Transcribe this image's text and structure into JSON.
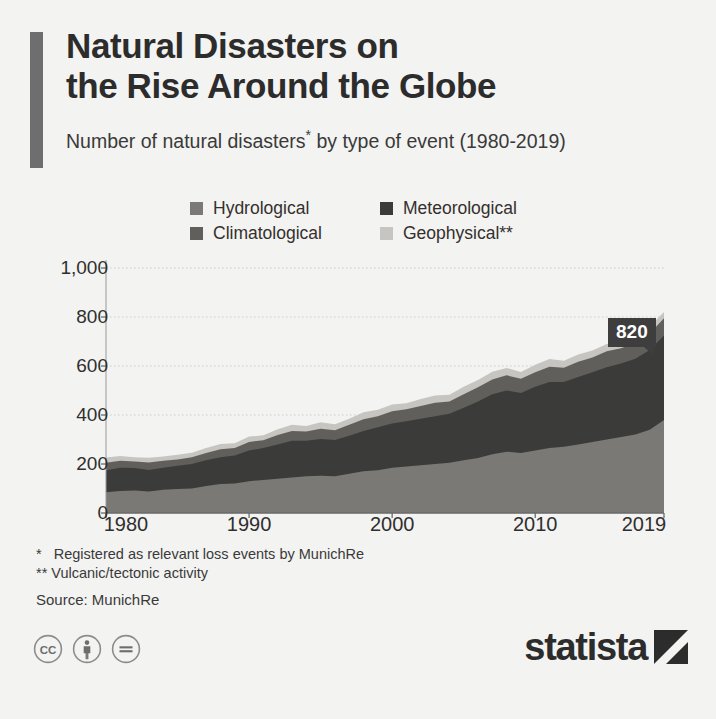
{
  "header": {
    "title": "Natural Disasters on\nthe Rise Around the Globe",
    "subtitle_pre": "Number of natural disasters",
    "subtitle_star": "*",
    "subtitle_post": " by type of event (1980-2019)"
  },
  "legend": {
    "items": [
      {
        "label": "Hydrological",
        "color": "#7a7976"
      },
      {
        "label": "Meteorological",
        "color": "#3b3b39"
      },
      {
        "label": "Climatological",
        "color": "#605f5c"
      },
      {
        "label": "Geophysical**",
        "color": "#c6c5c1"
      }
    ]
  },
  "footnotes": {
    "line1": "*   Registered as relevant loss events by MunichRe",
    "line2": "** Vulcanic/tectonic activity",
    "source": "Source: MunichRe"
  },
  "brand": {
    "word": "statista",
    "mark": "statista-logo-mark"
  },
  "cc_icons": [
    "cc-icon",
    "cc-by-icon",
    "cc-nd-icon"
  ],
  "chart_data": {
    "type": "area",
    "stacked": true,
    "title": "Natural Disasters on the Rise Around the Globe",
    "subtitle": "Number of natural disasters* by type of event (1980-2019)",
    "xlabel": "",
    "ylabel": "",
    "grid": true,
    "legend_position": "top",
    "xlim": [
      1980,
      2019
    ],
    "ylim": [
      0,
      1000
    ],
    "yticks": [
      0,
      200,
      400,
      600,
      800,
      1000
    ],
    "ytick_labels": [
      "0",
      "200",
      "400",
      "600",
      "800",
      "1,000"
    ],
    "xticks": [
      1980,
      1990,
      2000,
      2010,
      2019
    ],
    "xtick_labels": [
      "1980",
      "1990",
      "2000",
      "2010",
      "2019"
    ],
    "x": [
      1980,
      1981,
      1982,
      1983,
      1984,
      1985,
      1986,
      1987,
      1988,
      1989,
      1990,
      1991,
      1992,
      1993,
      1994,
      1995,
      1996,
      1997,
      1998,
      1999,
      2000,
      2001,
      2002,
      2003,
      2004,
      2005,
      2006,
      2007,
      2008,
      2009,
      2010,
      2011,
      2012,
      2013,
      2014,
      2015,
      2016,
      2017,
      2018,
      2019
    ],
    "series": [
      {
        "name": "Hydrological",
        "color": "#7a7976",
        "values": [
          85,
          90,
          92,
          88,
          95,
          98,
          100,
          110,
          118,
          120,
          130,
          135,
          140,
          145,
          150,
          152,
          150,
          160,
          170,
          175,
          185,
          190,
          195,
          200,
          205,
          215,
          225,
          240,
          250,
          245,
          255,
          265,
          270,
          280,
          290,
          300,
          310,
          320,
          340,
          380
        ]
      },
      {
        "name": "Meteorological",
        "color": "#3b3b39",
        "values": [
          90,
          95,
          92,
          88,
          90,
          95,
          100,
          105,
          110,
          115,
          125,
          130,
          140,
          150,
          145,
          150,
          148,
          155,
          165,
          175,
          180,
          185,
          190,
          195,
          200,
          215,
          230,
          245,
          250,
          245,
          260,
          270,
          265,
          275,
          285,
          295,
          300,
          310,
          325,
          345
        ]
      },
      {
        "name": "Climatological",
        "color": "#605f5c",
        "values": [
          30,
          28,
          26,
          30,
          28,
          25,
          28,
          30,
          32,
          30,
          35,
          32,
          38,
          40,
          38,
          42,
          40,
          45,
          48,
          45,
          50,
          48,
          52,
          55,
          50,
          55,
          58,
          60,
          62,
          58,
          60,
          62,
          58,
          62,
          60,
          65,
          62,
          65,
          68,
          70
        ]
      },
      {
        "name": "Geophysical**",
        "color": "#c6c5c1",
        "values": [
          22,
          20,
          18,
          20,
          18,
          20,
          18,
          20,
          22,
          20,
          22,
          20,
          24,
          25,
          22,
          26,
          24,
          25,
          28,
          26,
          28,
          25,
          28,
          30,
          28,
          30,
          30,
          32,
          30,
          28,
          30,
          32,
          28,
          30,
          28,
          30,
          28,
          30,
          28,
          25
        ]
      }
    ],
    "annotations": [
      {
        "label": "820",
        "x": 2019,
        "y": 820,
        "note": "total natural disasters in 2019"
      }
    ]
  }
}
